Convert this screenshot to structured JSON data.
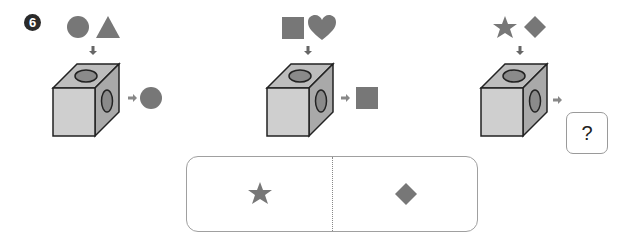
{
  "question": {
    "number_label": "6",
    "colors": {
      "shape": "#777777",
      "cube_front": "#cfcfcf",
      "cube_top": "#bdbdbd",
      "cube_side": "#a9a9a9",
      "hole": "#8a8a8a",
      "outline": "#222222",
      "arrow": "#777777"
    },
    "examples": [
      {
        "inputs": [
          "circle",
          "triangle"
        ],
        "output": "circle"
      },
      {
        "inputs": [
          "square",
          "heart"
        ],
        "output": "square"
      },
      {
        "inputs": [
          "star",
          "diamond"
        ],
        "output": "?"
      }
    ],
    "unknown_label": "?"
  },
  "answer_choices": [
    {
      "shape": "star"
    },
    {
      "shape": "diamond"
    }
  ]
}
